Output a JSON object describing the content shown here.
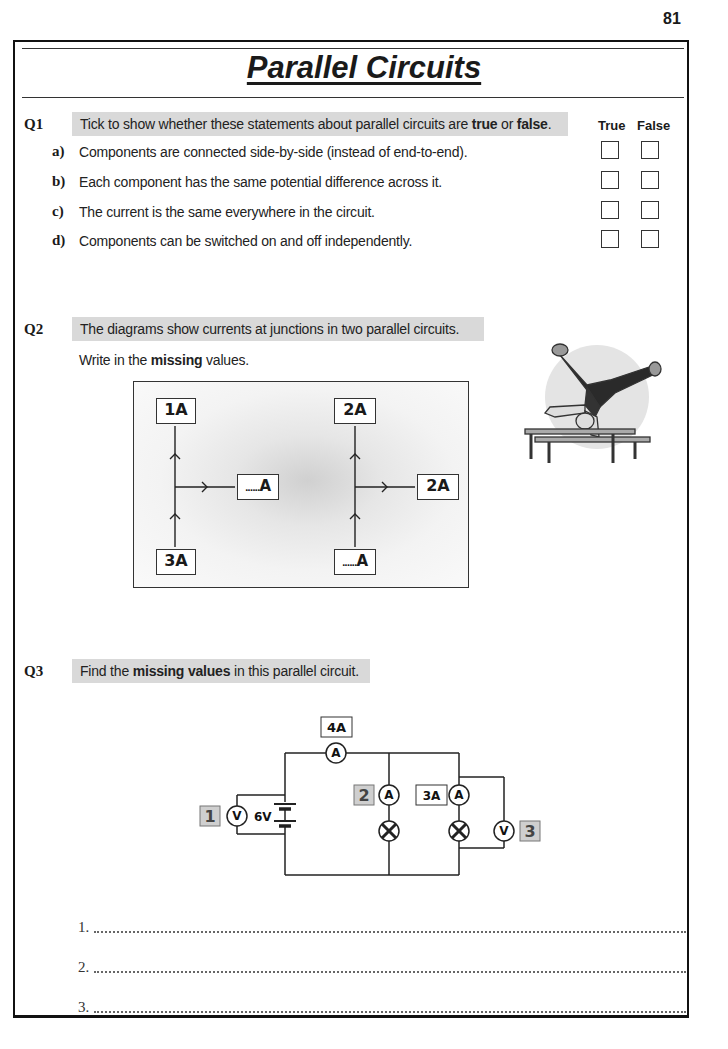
{
  "page": {
    "number": "81",
    "title": "Parallel Circuits"
  },
  "q1": {
    "number": "Q1",
    "instruction_pre": "Tick to show whether these statements about parallel circuits are ",
    "instruction_true": "true",
    "instruction_mid": " or ",
    "instruction_false": "false",
    "instruction_post": ".",
    "col_true": "True",
    "col_false": "False",
    "items": [
      {
        "letter": "a)",
        "text": "Components are connected side-by-side (instead of end-to-end)."
      },
      {
        "letter": "b)",
        "text": "Each component has the same potential difference across it."
      },
      {
        "letter": "c)",
        "text": "The current is the same everywhere in the circuit."
      },
      {
        "letter": "d)",
        "text": "Components can be switched on and off independently."
      }
    ]
  },
  "q2": {
    "number": "Q2",
    "instruction": "The diagrams show currents at junctions in two parallel circuits.",
    "sub_pre": "Write in the ",
    "sub_bold": "missing",
    "sub_post": " values.",
    "left_junction": {
      "top": "1A",
      "right": "A",
      "right_blank": "......",
      "bottom": "3A"
    },
    "right_junction": {
      "top": "2A",
      "right": "2A",
      "bottom": "A",
      "bottom_blank": "......"
    }
  },
  "q3": {
    "number": "Q3",
    "instruction_pre": "Find the ",
    "instruction_bold": "missing values",
    "instruction_post": " in this parallel circuit.",
    "circuit": {
      "main_ammeter_label": "4A",
      "battery_label": "6V",
      "branch2_ammeter_label": "3A",
      "unknown_1": "1",
      "unknown_2": "2",
      "unknown_3": "3",
      "ammeter_symbol": "A",
      "voltmeter_symbol": "V"
    },
    "answers": [
      {
        "label": "1."
      },
      {
        "label": "2."
      },
      {
        "label": "3."
      }
    ]
  }
}
